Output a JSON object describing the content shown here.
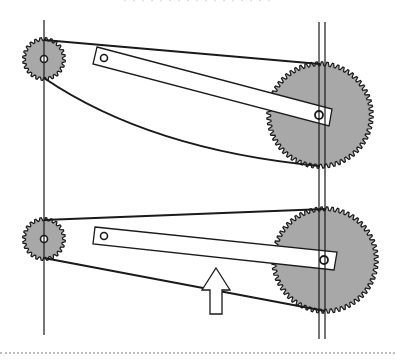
{
  "caption": "· · · · · · · · · · · · · · · · ·",
  "colors": {
    "stroke": "#1a1a1a",
    "gear_fill": "#a8a8a8",
    "background": "#ffffff",
    "divider": "#bdbdbd",
    "arrow_fill": "#ffffff"
  },
  "diagrams": [
    {
      "name": "top-mechanism",
      "guide_lines": [
        {
          "x": 44,
          "y1": 20,
          "y2": 335
        },
        {
          "x": 319,
          "y1": 22,
          "y2": 339
        },
        {
          "x": 325,
          "y1": 22,
          "y2": 339
        }
      ],
      "small_gear": {
        "cx": 44,
        "cy": 59,
        "r": 19,
        "teeth": 24,
        "tooth": 2.4,
        "hole_r": 3.5
      },
      "large_gear": {
        "cx": 320,
        "cy": 115,
        "r": 50,
        "teeth": 60,
        "tooth": 3.2,
        "hole_r": 4
      },
      "belt_top": {
        "x1": 44,
        "y1": 40,
        "x2": 320,
        "y2": 64
      },
      "belt_bottom": {
        "path": "M44 78 Q150 150 320 166"
      },
      "bar": {
        "points": "97,47 332,109 329,126 93,64"
      },
      "bar_hole": {
        "cx": 104,
        "cy": 58,
        "r": 3.5
      }
    },
    {
      "name": "bottom-mechanism",
      "small_gear": {
        "cx": 44,
        "cy": 239,
        "r": 19,
        "teeth": 24,
        "tooth": 2.4,
        "hole_r": 3.5
      },
      "large_gear": {
        "cx": 325,
        "cy": 260,
        "r": 50,
        "teeth": 60,
        "tooth": 3.2,
        "hole_r": 4
      },
      "belt_top": {
        "x1": 44,
        "y1": 220,
        "x2": 325,
        "y2": 209
      },
      "belt_bottom": {
        "path": "M44 258 L325 311"
      },
      "bar": {
        "points": "95,227 337,252 334,270 93,244"
      },
      "bar_hole": {
        "cx": 104,
        "cy": 236,
        "r": 3.5
      }
    }
  ],
  "arrow": {
    "direction": "up",
    "points": "216,268 230,290 222,290 222,314 210,314 210,290 202,290"
  }
}
